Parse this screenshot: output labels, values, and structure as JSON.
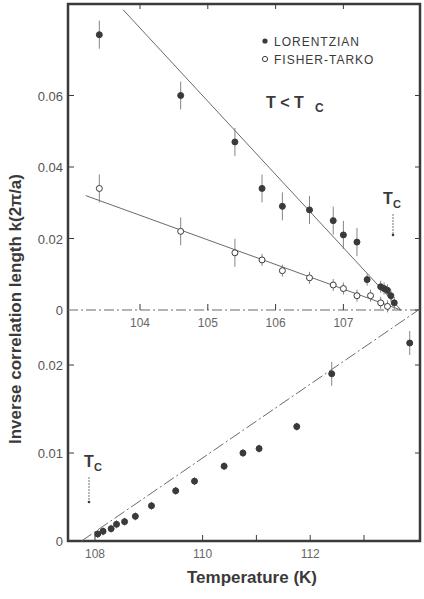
{
  "chart_data": [
    {
      "panel": "top",
      "type": "scatter",
      "title": "",
      "annotation": "T < Tc",
      "tc_marker_label": "Tc",
      "xlabel": "Temperature (K)",
      "ylabel": "Inverse correlation length k(2π/a)",
      "xlim": [
        103.2,
        108.3
      ],
      "ylim": [
        0,
        0.084
      ],
      "xticks": [
        104,
        105,
        106,
        107
      ],
      "xtick_labels": [
        "104",
        "105",
        "106",
        "107"
      ],
      "yticks": [
        0,
        0.02,
        0.04,
        0.06
      ],
      "ytick_labels": [
        "0",
        "0.02",
        "0.04",
        "0.06"
      ],
      "grid": false,
      "legend_position": "upper right",
      "series": [
        {
          "name": "LORENTZIAN",
          "marker": "filled-circle",
          "x": [
            103.4,
            104.6,
            105.4,
            105.8,
            106.1,
            106.5,
            106.85,
            107.0,
            107.2,
            107.35,
            107.55,
            107.6,
            107.65,
            107.7,
            107.75
          ],
          "y": [
            0.077,
            0.06,
            0.047,
            0.034,
            0.029,
            0.028,
            0.025,
            0.021,
            0.019,
            0.0085,
            0.0065,
            0.006,
            0.0055,
            0.004,
            0.002
          ],
          "fit_line": {
            "x": [
              103.75,
              107.85
            ],
            "y": [
              0.084,
              0.0
            ]
          }
        },
        {
          "name": "FISHER-TARKO",
          "marker": "open-circle",
          "x": [
            103.4,
            104.6,
            105.4,
            105.8,
            106.1,
            106.5,
            106.85,
            107.0,
            107.2,
            107.4,
            107.55,
            107.65
          ],
          "y": [
            0.034,
            0.022,
            0.016,
            0.014,
            0.011,
            0.009,
            0.007,
            0.006,
            0.004,
            0.004,
            0.002,
            0.001
          ],
          "fit_line": {
            "x": [
              103.2,
              107.85
            ],
            "y": [
              0.032,
              0.0
            ]
          }
        }
      ],
      "tc_arrow_x": 107.85
    },
    {
      "panel": "bottom",
      "type": "scatter",
      "title": "",
      "tc_marker_label": "Tc",
      "xlabel": "Temperature (K)",
      "ylabel": "Inverse correlation length k(2π/a)",
      "xlim": [
        107.5,
        114.0
      ],
      "ylim": [
        0,
        0.0265
      ],
      "xticks": [
        108,
        110,
        112
      ],
      "xtick_labels": [
        "108",
        "110",
        "112"
      ],
      "minor_xticks": [
        111,
        113
      ],
      "yticks": [
        0,
        0.01,
        0.02
      ],
      "ytick_labels": [
        "0",
        "0.01",
        "0.02"
      ],
      "grid": false,
      "series": [
        {
          "name": "LORENTZIAN",
          "marker": "filled-circle",
          "x": [
            108.05,
            108.15,
            108.3,
            108.4,
            108.55,
            108.75,
            109.05,
            109.5,
            109.85,
            110.4,
            110.75,
            111.05,
            111.75,
            112.4,
            113.85
          ],
          "y": [
            0.0008,
            0.0011,
            0.0014,
            0.0019,
            0.0022,
            0.0028,
            0.004,
            0.0057,
            0.0068,
            0.0085,
            0.01,
            0.0105,
            0.013,
            0.019,
            0.0225
          ],
          "fit_line": {
            "x": [
              107.75,
              114.0
            ],
            "y": [
              0.0,
              0.0262
            ]
          }
        }
      ],
      "tc_arrow_x": 108.0
    }
  ],
  "figure": {
    "ylabel": "Inverse correlation length k(2π/a)",
    "xlabel": "Temperature (K)",
    "legend": [
      {
        "label": "LORENTZIAN",
        "marker": "filled-circle"
      },
      {
        "label": "FISHER-TARKO",
        "marker": "open-circle"
      }
    ],
    "annotation_condition": "T < T",
    "annotation_sub": "C",
    "tc_label_main": "T",
    "tc_label_sub": "C",
    "ink_color": "#3a3a3a",
    "line_color": "#6a6a6a"
  }
}
